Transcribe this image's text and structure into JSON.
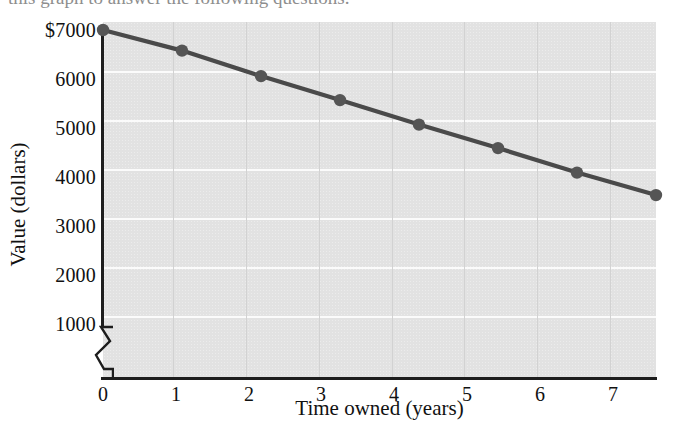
{
  "page": {
    "top_cut_text": "this graph to answer the following questions."
  },
  "chart_data": {
    "type": "line",
    "title": "",
    "xlabel": "Time owned (years)",
    "ylabel": "Value (dollars)",
    "x": [
      0,
      1,
      2,
      3,
      4,
      5,
      6,
      7
    ],
    "values": [
      7000,
      6580,
      6060,
      5570,
      5070,
      4590,
      4090,
      3630
    ],
    "series": [
      {
        "name": "Value",
        "values": [
          7000,
          6580,
          6060,
          5570,
          5070,
          4590,
          4090,
          3630
        ]
      }
    ],
    "x_tick_labels": [
      "0",
      "1",
      "2",
      "3",
      "4",
      "5",
      "6",
      "7"
    ],
    "y_tick_labels": [
      "1000",
      "2000",
      "3000",
      "4000",
      "5000",
      "6000",
      "$7000"
    ],
    "y_tick_values": [
      1000,
      2000,
      3000,
      4000,
      5000,
      6000,
      7000
    ],
    "xlim": [
      0,
      7
    ],
    "ylim": [
      700,
      7100
    ],
    "grid": true,
    "axis_break_y": true,
    "legend": "none",
    "colors": {
      "plot_background": "#e2e2e2",
      "horizontal_gridline": "#fbfbfb",
      "vertical_gridline": "#d2d2d2",
      "line": "#4a4a4a",
      "marker": "#555555",
      "axis": "#1d1d1d",
      "text": "#111111"
    }
  }
}
